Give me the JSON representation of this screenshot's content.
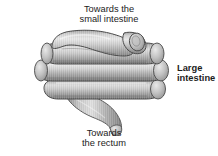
{
  "figure": {
    "name": "large-intestine-diagram",
    "background_color": "#ffffff",
    "style": "grayscale shaded anatomical drawing"
  },
  "labels": {
    "top": {
      "name": "label-small-intestine",
      "line1": "Towards the",
      "line2": "small intestine",
      "bold": false
    },
    "right": {
      "name": "label-large-intestine",
      "line1": "Large",
      "line2": "intestine",
      "bold": true
    },
    "bottom": {
      "name": "label-rectum",
      "line1": "Towards",
      "line2": "the rectum",
      "bold": false
    }
  },
  "illustration": {
    "name": "large-intestine-illustration",
    "description": "Coiled tube of the large intestine shown as stacked horizontal loops, with an opening at the upper right leading to the small intestine and a tapering tube descending at the lower centre leading to the rectum.",
    "colors": {
      "highlight": "#e2e2e2",
      "midtone": "#b8b8b8",
      "shadow": "#8a8a8a",
      "deep_shadow": "#6e6e6e",
      "outline": "#4a4a4a"
    },
    "parts": [
      {
        "name": "small-intestine-opening",
        "note": "rounded tube end at upper right"
      },
      {
        "name": "coil-loop-1",
        "note": "top horizontal loop"
      },
      {
        "name": "coil-loop-2",
        "note": "upper middle horizontal loop"
      },
      {
        "name": "coil-loop-3",
        "note": "lower middle horizontal loop"
      },
      {
        "name": "coil-loop-4",
        "note": "bottom horizontal loop"
      },
      {
        "name": "rectum-tube",
        "note": "tapering tube descending at lower centre"
      }
    ]
  }
}
